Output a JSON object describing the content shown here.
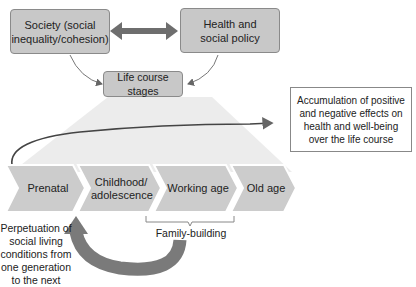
{
  "boxes": {
    "society": "Society (social inequality/cohesion)",
    "health_policy": "Health and social policy",
    "life_course": "Life course stages",
    "accumulation": "Accumulation of positive and negative effects on health and well-being over the life course"
  },
  "stages": [
    {
      "label": "Prenatal"
    },
    {
      "label": "Childhood/ adolescence"
    },
    {
      "label": "Working age"
    },
    {
      "label": "Old age"
    }
  ],
  "labels": {
    "family_building": "Family-building",
    "perpetuation": "Perpetuation of social living conditions from one generation to the next"
  },
  "colors": {
    "box_fill": "#c8c8c8",
    "arrow": "#7a7a7a",
    "stage_fill": "#cccccc",
    "fan": "#ececec"
  }
}
